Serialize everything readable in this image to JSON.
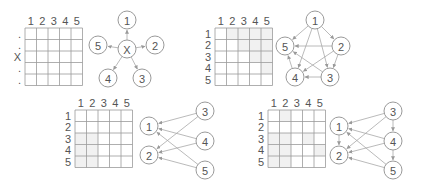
{
  "panels": [
    {
      "id": "star",
      "col_labels": [
        "1",
        "2",
        "3",
        "4",
        "5"
      ],
      "row_labels": [
        ".",
        ".",
        "X",
        ".",
        "."
      ],
      "shaded_cells": [],
      "nodes": [
        {
          "id": "X",
          "label": "X"
        },
        {
          "id": "1",
          "label": "1"
        },
        {
          "id": "2",
          "label": "2"
        },
        {
          "id": "3",
          "label": "3"
        },
        {
          "id": "4",
          "label": "4"
        },
        {
          "id": "5",
          "label": "5"
        }
      ],
      "edges": [
        [
          "X",
          "1"
        ],
        [
          "X",
          "2"
        ],
        [
          "X",
          "3"
        ],
        [
          "X",
          "4"
        ],
        [
          "X",
          "5"
        ]
      ]
    },
    {
      "id": "pentagon",
      "col_labels": [
        "1",
        "2",
        "3",
        "4",
        "5"
      ],
      "row_labels": [
        "1",
        "2",
        "3",
        "4",
        "5"
      ],
      "shaded_cells": [
        [
          1,
          2
        ],
        [
          1,
          3
        ],
        [
          1,
          4
        ],
        [
          1,
          5
        ],
        [
          2,
          3
        ],
        [
          2,
          4
        ],
        [
          2,
          5
        ],
        [
          3,
          4
        ],
        [
          3,
          5
        ],
        [
          4,
          5
        ]
      ],
      "nodes": [
        {
          "id": "1",
          "label": "1"
        },
        {
          "id": "2",
          "label": "2"
        },
        {
          "id": "3",
          "label": "3"
        },
        {
          "id": "4",
          "label": "4"
        },
        {
          "id": "5",
          "label": "5"
        }
      ],
      "edges": [
        [
          "1",
          "5"
        ],
        [
          "1",
          "2"
        ],
        [
          "1",
          "4"
        ],
        [
          "1",
          "3"
        ],
        [
          "2",
          "5"
        ],
        [
          "2",
          "4"
        ],
        [
          "2",
          "3"
        ],
        [
          "3",
          "4"
        ],
        [
          "3",
          "5"
        ],
        [
          "4",
          "5"
        ]
      ]
    },
    {
      "id": "bipartite",
      "col_labels": [
        "1",
        "2",
        "3",
        "4",
        "5"
      ],
      "row_labels": [
        "1",
        "2",
        "3",
        "4",
        "5"
      ],
      "shaded_cells": [
        [
          3,
          1
        ],
        [
          3,
          2
        ],
        [
          4,
          1
        ],
        [
          4,
          2
        ],
        [
          5,
          1
        ],
        [
          5,
          2
        ]
      ],
      "nodes": [
        {
          "id": "1",
          "label": "1"
        },
        {
          "id": "2",
          "label": "2"
        },
        {
          "id": "3",
          "label": "3"
        },
        {
          "id": "4",
          "label": "4"
        },
        {
          "id": "5",
          "label": "5"
        }
      ],
      "edges": [
        [
          "3",
          "1"
        ],
        [
          "3",
          "2"
        ],
        [
          "4",
          "1"
        ],
        [
          "4",
          "2"
        ],
        [
          "5",
          "1"
        ],
        [
          "5",
          "2"
        ]
      ]
    },
    {
      "id": "bipartite-chain",
      "col_labels": [
        "1",
        "2",
        "3",
        "4",
        "5"
      ],
      "row_labels": [
        "1",
        "2",
        "3",
        "4",
        "5"
      ],
      "shaded_cells": [
        [
          1,
          2
        ],
        [
          3,
          1
        ],
        [
          3,
          2
        ],
        [
          3,
          4
        ],
        [
          4,
          1
        ],
        [
          4,
          2
        ],
        [
          4,
          5
        ],
        [
          5,
          1
        ],
        [
          5,
          2
        ]
      ],
      "nodes": [
        {
          "id": "1",
          "label": "1"
        },
        {
          "id": "2",
          "label": "2"
        },
        {
          "id": "3",
          "label": "3"
        },
        {
          "id": "4",
          "label": "4"
        },
        {
          "id": "5",
          "label": "5"
        }
      ],
      "edges": [
        [
          "1",
          "2"
        ],
        [
          "3",
          "4"
        ],
        [
          "4",
          "5"
        ],
        [
          "3",
          "1"
        ],
        [
          "3",
          "2"
        ],
        [
          "4",
          "1"
        ],
        [
          "4",
          "2"
        ],
        [
          "5",
          "1"
        ],
        [
          "5",
          "2"
        ]
      ]
    }
  ]
}
